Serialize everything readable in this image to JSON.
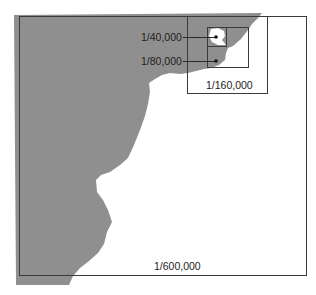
{
  "diagram": {
    "type": "map-scale-insets",
    "colors": {
      "land": "#8f8f8f",
      "water": "#ffffff",
      "frame": "#3a3a3a"
    },
    "scales": [
      {
        "id": "outer",
        "label": "1/600,000"
      },
      {
        "id": "inset-160k",
        "label": "1/160,000"
      },
      {
        "id": "inset-80k",
        "label": "1/80,000"
      },
      {
        "id": "inset-40k",
        "label": "1/40,000"
      }
    ]
  }
}
